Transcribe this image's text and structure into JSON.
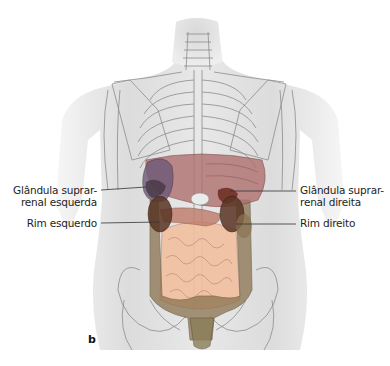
{
  "figure": {
    "panel_letter": "b",
    "colors": {
      "body_skin": "#ebebeb",
      "bone_line": "#8a8a8a",
      "liver": "#b07070",
      "stomach": "#9a8aa0",
      "kidney": "#5a3525",
      "adrenal": "#7a3a2a",
      "colon": "#8a7350",
      "small_intestine": "#f2c0a0",
      "pancreas": "#c08070",
      "leader_line": "#333333"
    },
    "labels": [
      {
        "id": "left-adrenal",
        "side": "left",
        "lines": [
          "Glândula suprar-",
          "renal esquerda"
        ]
      },
      {
        "id": "left-kidney",
        "side": "left",
        "lines": [
          "Rim esquerdo"
        ]
      },
      {
        "id": "right-adrenal",
        "side": "right",
        "lines": [
          "Glândula suprar-",
          "renal direita"
        ]
      },
      {
        "id": "right-kidney",
        "side": "right",
        "lines": [
          "Rim direito"
        ]
      }
    ]
  }
}
